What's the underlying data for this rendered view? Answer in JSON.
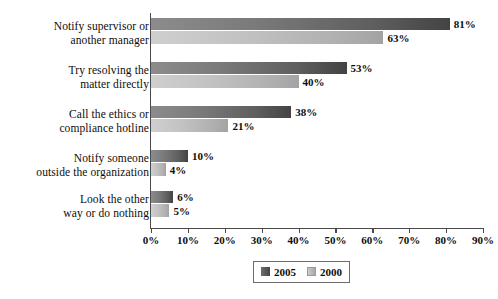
{
  "chart_data": {
    "type": "bar",
    "orientation": "horizontal",
    "title": "",
    "subtitle": "",
    "xlabel": "",
    "ylabel": "",
    "xlim": [
      0,
      90
    ],
    "xticks": [
      "0%",
      "10%",
      "20%",
      "30%",
      "40%",
      "50%",
      "60%",
      "70%",
      "80%",
      "90%"
    ],
    "xtick_values": [
      0,
      10,
      20,
      30,
      40,
      50,
      60,
      70,
      80,
      90
    ],
    "grid": false,
    "legend_position": "bottom-center",
    "categories": [
      "Notify supervisor or\nanother manager",
      "Try resolving the\nmatter directly",
      "Call the ethics or\ncompliance hotline",
      "Notify someone\noutside the organization",
      "Look the other\nway or do nothing"
    ],
    "series": [
      {
        "name": "2005",
        "color": "#5e5e5e",
        "values": [
          81,
          53,
          38,
          10,
          6
        ],
        "labels": [
          "81%",
          "53%",
          "38%",
          "10%",
          "6%"
        ]
      },
      {
        "name": "2000",
        "color": "#b8b8b8",
        "values": [
          63,
          40,
          21,
          4,
          5
        ],
        "labels": [
          "63%",
          "40%",
          "21%",
          "4%",
          "5%"
        ]
      }
    ]
  },
  "legend": {
    "items": [
      {
        "label": "2005",
        "swatch": "dark-gray-swatch"
      },
      {
        "label": "2000",
        "swatch": "light-gray-swatch"
      }
    ]
  },
  "axis": {
    "x_axis_name": "percent-axis",
    "y_axis_name": "category-axis"
  }
}
